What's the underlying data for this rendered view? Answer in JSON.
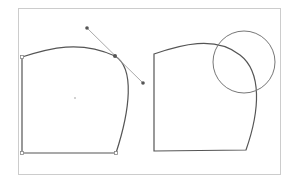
{
  "diagram": {
    "title": "",
    "frame": {
      "x": 18,
      "y": 8,
      "w": 262,
      "h": 166,
      "stroke": "#cccccc"
    },
    "colors": {
      "shape_stroke": "#555555",
      "handle_line": "#aaaaaa",
      "point_fill": "#555555",
      "corner_fill": "#ffffff",
      "circle_stroke": "#777777"
    },
    "left_shape": {
      "label": "shape with selected anchor and bezier handles",
      "corners": [
        [
          22,
          57
        ],
        [
          22,
          153
        ],
        [
          116,
          153
        ]
      ],
      "anchor": [
        115,
        56
      ],
      "handle_in": [
        87,
        28
      ],
      "handle_out": [
        143,
        83
      ],
      "center": [
        75,
        98
      ]
    },
    "right_shape": {
      "label": "shape with circle overlay",
      "circle": {
        "cx": 244,
        "cy": 62,
        "r": 31
      }
    }
  }
}
